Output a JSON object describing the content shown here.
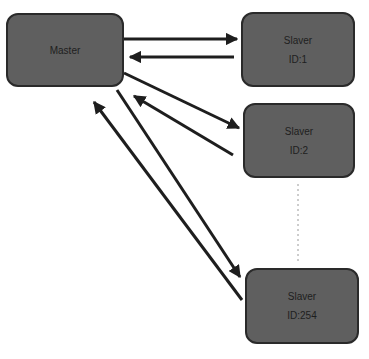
{
  "diagram": {
    "type": "master-slave communication",
    "colors": {
      "node_fill": "#5f5f5f",
      "node_border": "#2a2a2a",
      "arrow": "#1e1e1e",
      "text": "#1e1e1e",
      "background": "#ffffff"
    },
    "master": {
      "label": "Master"
    },
    "slaves": [
      {
        "label": "Slaver",
        "id": "ID:1"
      },
      {
        "label": "Slaver",
        "id": "ID:2"
      },
      {
        "label": "Slaver",
        "id": "ID:254"
      }
    ],
    "connections": [
      {
        "from": "Master",
        "to": "Slaver ID:1"
      },
      {
        "from": "Slaver ID:1",
        "to": "Master"
      },
      {
        "from": "Master",
        "to": "Slaver ID:2"
      },
      {
        "from": "Slaver ID:2",
        "to": "Master"
      },
      {
        "from": "Master",
        "to": "Slaver ID:254"
      },
      {
        "from": "Slaver ID:254",
        "to": "Master"
      }
    ],
    "ellipsis": "dashed vertical line between ID:2 and ID:254"
  }
}
